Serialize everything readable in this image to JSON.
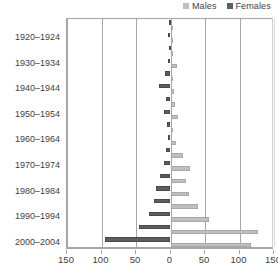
{
  "legend": {
    "position": "top-right",
    "items": [
      {
        "label": "Males",
        "color": "#bfbfbf",
        "icon": "legend-swatch-icon"
      },
      {
        "label": "Females",
        "color": "#5e5e5e",
        "icon": "legend-swatch-icon"
      }
    ]
  },
  "axis": {
    "x_ticks": [
      "150",
      "100",
      "50",
      "0",
      "50",
      "100",
      "150"
    ],
    "x_tick_values": [
      -150,
      -100,
      -50,
      0,
      50,
      100,
      150
    ],
    "x_min": -150,
    "x_max": 150
  },
  "chart_data": {
    "type": "bar",
    "subtype": "population-pyramid",
    "title": "",
    "xlabel": "",
    "ylabel": "",
    "xlim": [
      -150,
      150
    ],
    "grid": true,
    "legend_position": "top-right",
    "orientation": "horizontal",
    "categories": [
      "1915-1919",
      "1920-1924",
      "1925-1929",
      "1930-1934",
      "1935-1939",
      "1940-1944",
      "1945-1949",
      "1950-1954",
      "1955-1959",
      "1960-1964",
      "1965-1969",
      "1970-1974",
      "1975-1979",
      "1980-1984",
      "1985-1989",
      "1990-1994",
      "1995-1999",
      "2000-2004"
    ],
    "visible_tick_labels": [
      "1920-1924",
      "1930-1934",
      "1940-1944",
      "1950-1954",
      "1960-1964",
      "1970-1974",
      "1980-1984",
      "1990-1994",
      "2000-2004"
    ],
    "series": [
      {
        "name": "Females",
        "color": "#5e5e5e",
        "side": "left",
        "values": [
          1,
          3,
          2,
          4,
          8,
          16,
          7,
          9,
          5,
          3,
          6,
          10,
          15,
          21,
          24,
          31,
          46,
          95
        ]
      },
      {
        "name": "Males",
        "color": "#bfbfbf",
        "side": "right",
        "values": [
          1,
          2,
          3,
          9,
          4,
          5,
          6,
          11,
          4,
          8,
          18,
          28,
          23,
          27,
          40,
          56,
          127,
          116
        ]
      }
    ]
  }
}
